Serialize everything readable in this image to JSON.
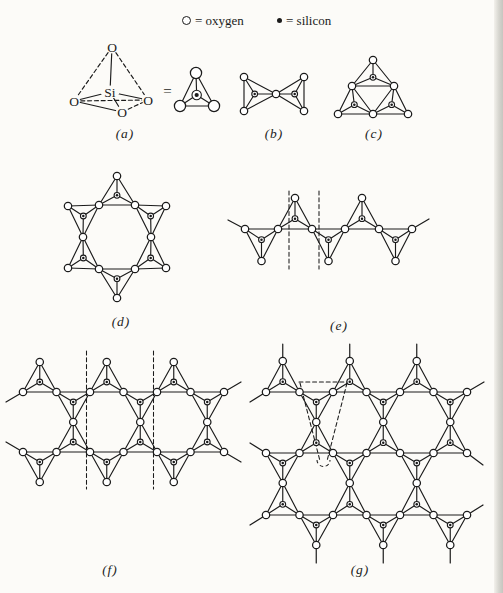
{
  "meta": {
    "bg": "#fcfbf8",
    "ink": "#1b1b1b",
    "width": 503,
    "height": 593
  },
  "legend": {
    "oxygen_symbol": "open-circle",
    "oxygen_text": "= oxygen",
    "silicon_symbol": "filled-dot",
    "silicon_text": "= silicon"
  },
  "tetrahedron_3d": {
    "nodes": [
      {
        "label": "O",
        "x": 112,
        "y": 47,
        "rx": 6,
        "ry": 6.5
      },
      {
        "label": "O",
        "x": 74,
        "y": 101,
        "rx": 6,
        "ry": 6.5
      },
      {
        "label": "O",
        "x": 148,
        "y": 100,
        "rx": 6,
        "ry": 6.5
      },
      {
        "label": "O",
        "x": 122,
        "y": 112,
        "rx": 6,
        "ry": 6.5
      },
      {
        "label": "Si",
        "x": 110,
        "y": 92,
        "rx": 9.5,
        "ry": 6.5
      }
    ],
    "bonds": [
      [
        0,
        4,
        "solid"
      ],
      [
        1,
        4,
        "solid"
      ],
      [
        2,
        4,
        "solid"
      ],
      [
        3,
        4,
        "solid"
      ],
      [
        0,
        1,
        "dashed"
      ],
      [
        0,
        2,
        "dashed"
      ],
      [
        1,
        2,
        "dashed"
      ],
      [
        1,
        3,
        "solid"
      ],
      [
        3,
        2,
        "dashed"
      ]
    ]
  },
  "labels": [
    {
      "name": "panel-label-a",
      "text": "(a)",
      "x": 125,
      "y": 134,
      "italic": true
    },
    {
      "name": "panel-label-b",
      "text": "(b)",
      "x": 274,
      "y": 134,
      "italic": true
    },
    {
      "name": "panel-label-c",
      "text": "(c)",
      "x": 374,
      "y": 134,
      "italic": true
    },
    {
      "name": "panel-label-d",
      "text": "(d)",
      "x": 121,
      "y": 322,
      "italic": true
    },
    {
      "name": "panel-label-e",
      "text": "(e)",
      "x": 339,
      "y": 326,
      "italic": true
    },
    {
      "name": "panel-label-f",
      "text": "(f)",
      "x": 110,
      "y": 570,
      "italic": true
    },
    {
      "name": "panel-label-g",
      "text": "(g)",
      "x": 360,
      "y": 570,
      "italic": true
    },
    {
      "name": "equals-sign",
      "text": "=",
      "x": 168,
      "y": 91,
      "italic": false,
      "size": 15
    }
  ],
  "structures": [
    {
      "id": "a-schematic",
      "r_o": 5.6,
      "r_si": 4.7,
      "r_dot": 2.1,
      "triangles": [
        [
          [
            196,
            73
          ],
          [
            180,
            106
          ],
          [
            214,
            106
          ]
        ]
      ]
    },
    {
      "id": "b",
      "triangles": [
        [
          [
            244,
            77
          ],
          [
            244,
            111
          ],
          [
            276,
            94
          ]
        ],
        [
          [
            304,
            77
          ],
          [
            304,
            111
          ],
          [
            276,
            94
          ]
        ]
      ]
    },
    {
      "id": "c",
      "triangles": [
        [
          [
            373,
            60
          ],
          [
            352,
            86
          ],
          [
            394,
            86
          ]
        ],
        [
          [
            338,
            114
          ],
          [
            352,
            86
          ],
          [
            373,
            114
          ]
        ],
        [
          [
            373,
            114
          ],
          [
            394,
            86
          ],
          [
            408,
            114
          ]
        ]
      ]
    },
    {
      "id": "d",
      "triangles": [
        [
          [
            117,
            176
          ],
          [
            99,
            205
          ],
          [
            135,
            205
          ]
        ],
        [
          [
            166,
            206
          ],
          [
            135,
            205
          ],
          [
            151,
            237
          ]
        ],
        [
          [
            166,
            268
          ],
          [
            151,
            237
          ],
          [
            135,
            269
          ]
        ],
        [
          [
            117,
            298
          ],
          [
            135,
            269
          ],
          [
            99,
            269
          ]
        ],
        [
          [
            68,
            268
          ],
          [
            99,
            269
          ],
          [
            83,
            237
          ]
        ],
        [
          [
            68,
            206
          ],
          [
            83,
            237
          ],
          [
            99,
            205
          ]
        ]
      ]
    },
    {
      "id": "e",
      "triangles": [
        [
          [
            245,
            229
          ],
          [
            278,
            229
          ],
          [
            261.5,
            261
          ]
        ],
        [
          [
            278,
            229
          ],
          [
            312,
            229
          ],
          [
            295,
            198
          ]
        ],
        [
          [
            312,
            229
          ],
          [
            345,
            229
          ],
          [
            328.5,
            261
          ]
        ],
        [
          [
            345,
            229
          ],
          [
            379,
            229
          ],
          [
            362,
            198
          ]
        ],
        [
          [
            379,
            229
          ],
          [
            412,
            229
          ],
          [
            395.5,
            261
          ]
        ]
      ],
      "stubs": [
        [
          [
            245,
            229
          ],
          [
            228,
            220
          ]
        ],
        [
          [
            412,
            229
          ],
          [
            429,
            219
          ]
        ]
      ],
      "dashed": [
        [
          [
            289,
            191
          ],
          [
            289,
            269
          ]
        ],
        [
          [
            319,
            191
          ],
          [
            319,
            269
          ]
        ]
      ]
    },
    {
      "id": "f",
      "triangles": [
        [
          [
            23,
            392
          ],
          [
            56.5,
            392
          ],
          [
            39.75,
            362
          ]
        ],
        [
          [
            90,
            392
          ],
          [
            123.5,
            392
          ],
          [
            106.75,
            362
          ]
        ],
        [
          [
            157,
            392
          ],
          [
            190.5,
            392
          ],
          [
            173.75,
            362
          ]
        ],
        [
          [
            56.5,
            392
          ],
          [
            90,
            392
          ],
          [
            73.25,
            422
          ]
        ],
        [
          [
            123.5,
            392
          ],
          [
            157,
            392
          ],
          [
            140.25,
            422
          ]
        ],
        [
          [
            190.5,
            392
          ],
          [
            224,
            392
          ],
          [
            207.25,
            422
          ]
        ],
        [
          [
            56.5,
            452
          ],
          [
            90,
            452
          ],
          [
            73.25,
            422
          ]
        ],
        [
          [
            123.5,
            452
          ],
          [
            157,
            452
          ],
          [
            140.25,
            422
          ]
        ],
        [
          [
            190.5,
            452
          ],
          [
            224,
            452
          ],
          [
            207.25,
            422
          ]
        ],
        [
          [
            23,
            452
          ],
          [
            56.5,
            452
          ],
          [
            39.75,
            482
          ]
        ],
        [
          [
            90,
            452
          ],
          [
            123.5,
            452
          ],
          [
            106.75,
            482
          ]
        ],
        [
          [
            157,
            452
          ],
          [
            190.5,
            452
          ],
          [
            173.75,
            482
          ]
        ]
      ],
      "stubs": [
        [
          [
            23,
            392
          ],
          [
            6,
            402
          ]
        ],
        [
          [
            224,
            392
          ],
          [
            241,
            382
          ]
        ],
        [
          [
            23,
            452
          ],
          [
            6,
            442
          ]
        ],
        [
          [
            224,
            452
          ],
          [
            241,
            462
          ]
        ]
      ],
      "dashed": [
        [
          [
            86.5,
            351
          ],
          [
            86.5,
            489
          ]
        ],
        [
          [
            153.5,
            351
          ],
          [
            153.5,
            489
          ]
        ]
      ]
    },
    {
      "id": "g",
      "triangles": [
        [
          [
            266,
            392
          ],
          [
            299.5,
            392
          ],
          [
            282.75,
            361
          ]
        ],
        [
          [
            333,
            392
          ],
          [
            366.5,
            392
          ],
          [
            349.75,
            361
          ]
        ],
        [
          [
            400,
            392
          ],
          [
            433.5,
            392
          ],
          [
            416.75,
            361
          ]
        ],
        [
          [
            299.5,
            392
          ],
          [
            333,
            392
          ],
          [
            316.25,
            422
          ]
        ],
        [
          [
            366.5,
            392
          ],
          [
            400,
            392
          ],
          [
            383.25,
            422
          ]
        ],
        [
          [
            433.5,
            392
          ],
          [
            467,
            392
          ],
          [
            450.25,
            422
          ]
        ],
        [
          [
            299.5,
            453
          ],
          [
            333,
            453
          ],
          [
            316.25,
            422
          ]
        ],
        [
          [
            366.5,
            453
          ],
          [
            400,
            453
          ],
          [
            383.25,
            422
          ]
        ],
        [
          [
            433.5,
            453
          ],
          [
            467,
            453
          ],
          [
            450.25,
            422
          ]
        ],
        [
          [
            266,
            453
          ],
          [
            299.5,
            453
          ],
          [
            282.75,
            483
          ]
        ],
        [
          [
            333,
            453
          ],
          [
            366.5,
            453
          ],
          [
            349.75,
            483
          ]
        ],
        [
          [
            400,
            453
          ],
          [
            433.5,
            453
          ],
          [
            416.75,
            483
          ]
        ],
        [
          [
            266,
            515
          ],
          [
            299.5,
            515
          ],
          [
            282.75,
            483
          ]
        ],
        [
          [
            333,
            515
          ],
          [
            366.5,
            515
          ],
          [
            349.75,
            483
          ]
        ],
        [
          [
            400,
            515
          ],
          [
            433.5,
            515
          ],
          [
            416.75,
            483
          ]
        ],
        [
          [
            299.5,
            515
          ],
          [
            333,
            515
          ],
          [
            316.25,
            545
          ]
        ],
        [
          [
            366.5,
            515
          ],
          [
            400,
            515
          ],
          [
            383.25,
            545
          ]
        ],
        [
          [
            433.5,
            515
          ],
          [
            467,
            515
          ],
          [
            450.25,
            545
          ]
        ]
      ],
      "stubs": [
        [
          [
            282.75,
            361
          ],
          [
            282.75,
            344
          ]
        ],
        [
          [
            349.75,
            361
          ],
          [
            349.75,
            344
          ]
        ],
        [
          [
            416.75,
            361
          ],
          [
            416.75,
            344
          ]
        ],
        [
          [
            316.25,
            545
          ],
          [
            316.25,
            563
          ]
        ],
        [
          [
            383.25,
            545
          ],
          [
            383.25,
            563
          ]
        ],
        [
          [
            450.25,
            545
          ],
          [
            450.25,
            563
          ]
        ],
        [
          [
            266,
            392
          ],
          [
            250,
            402
          ]
        ],
        [
          [
            266,
            453
          ],
          [
            250,
            443
          ]
        ],
        [
          [
            266,
            515
          ],
          [
            250,
            525
          ]
        ],
        [
          [
            467,
            392
          ],
          [
            484,
            382
          ]
        ],
        [
          [
            467,
            453
          ],
          [
            483,
            465
          ]
        ],
        [
          [
            467,
            515
          ],
          [
            483,
            505
          ]
        ]
      ],
      "dashed": [
        [
          [
            299,
            382
          ],
          [
            348,
            382
          ]
        ],
        [
          [
            300,
            383
          ],
          [
            320,
            461
          ]
        ],
        [
          [
            347,
            383
          ],
          [
            327,
            461
          ]
        ]
      ],
      "dashed_paths": [
        "M 317 460 A 6.5 6.5 0 0 0 330 460"
      ]
    }
  ]
}
